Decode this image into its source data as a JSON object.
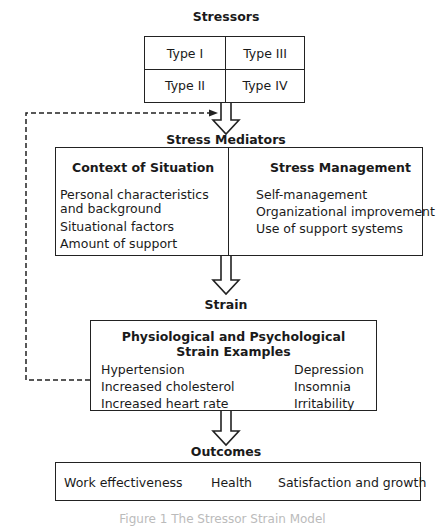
{
  "stressors": {
    "title": "Stressors",
    "types": [
      "Type I",
      "Type III",
      "Type II",
      "Type IV"
    ]
  },
  "mediators": {
    "title": "Stress Mediators",
    "context": {
      "heading": "Context of Situation",
      "items": [
        "Personal characteristics",
        "and background",
        "Situational factors",
        "Amount of support"
      ]
    },
    "management": {
      "heading": "Stress Management",
      "items": [
        "Self-management",
        "Organizational improvement",
        "Use of support systems"
      ]
    }
  },
  "strain": {
    "title": "Strain",
    "heading_line1": "Physiological and Psychological",
    "heading_line2": "Strain Examples",
    "physiological": [
      "Hypertension",
      "Increased cholesterol",
      "Increased heart rate"
    ],
    "psychological": [
      "Depression",
      "Insomnia",
      "Irritability"
    ]
  },
  "outcomes": {
    "title": "Outcomes",
    "left": "Work effectiveness",
    "center": "Health",
    "right": "Satisfaction and growth"
  },
  "caption": "Figure 1  The Stressor Strain Model"
}
